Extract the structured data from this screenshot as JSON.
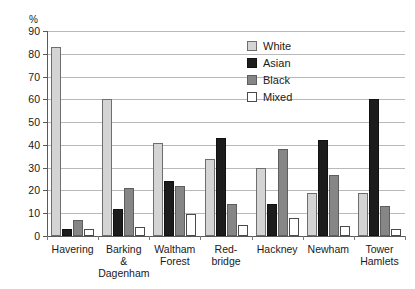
{
  "chart_data": {
    "type": "bar",
    "title": "",
    "subtitle": "",
    "xlabel": "",
    "ylabel": "%",
    "ylim": [
      0,
      90
    ],
    "ytick_step": 10,
    "yticks": [
      0,
      10,
      20,
      30,
      40,
      50,
      60,
      70,
      80,
      90
    ],
    "ytick_labels": [
      "0",
      "10",
      "20",
      "30",
      "40",
      "50",
      "60",
      "70",
      "80",
      "90"
    ],
    "grid": true,
    "grid_axis": "y",
    "legend_position": "top-right",
    "categories": [
      "Havering",
      "Barking & Dagenham",
      "Waltham Forest",
      "Red-bridge",
      "Hackney",
      "Newham",
      "Tower Hamlets"
    ],
    "category_label_lines": [
      [
        "Havering"
      ],
      [
        "Barking",
        "&",
        "Dagenham"
      ],
      [
        "Waltham",
        "Forest"
      ],
      [
        "Red-",
        "bridge"
      ],
      [
        "Hackney"
      ],
      [
        "Newham"
      ],
      [
        "Tower",
        "Hamlets"
      ]
    ],
    "series": [
      {
        "name": "White",
        "color": "#d4d4d4",
        "values": [
          83,
          60,
          41,
          34,
          30,
          19,
          19
        ]
      },
      {
        "name": "Asian",
        "color": "#1c1c1c",
        "values": [
          3,
          12,
          24,
          43,
          14,
          42,
          60
        ]
      },
      {
        "name": "Black",
        "color": "#868686",
        "values": [
          7,
          21,
          22,
          14,
          38,
          27,
          13
        ]
      },
      {
        "name": "Mixed",
        "color": "#ffffff",
        "values": [
          3,
          4,
          9.5,
          5,
          8,
          4.5,
          3
        ]
      }
    ],
    "annotations": []
  },
  "legend": {
    "items": [
      {
        "label": "White",
        "swatch": "white"
      },
      {
        "label": "Asian",
        "swatch": "asian"
      },
      {
        "label": "Black",
        "swatch": "black"
      },
      {
        "label": "Mixed",
        "swatch": "mixed"
      }
    ]
  }
}
